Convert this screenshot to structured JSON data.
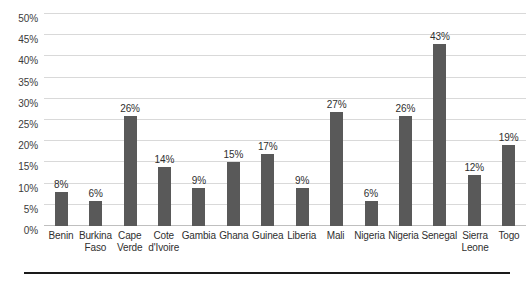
{
  "chart_data": {
    "type": "bar",
    "title": "",
    "subtitle": "",
    "xlabel": "",
    "ylabel": "",
    "ylim": [
      0,
      50
    ],
    "grid": true,
    "legend": false,
    "legend_position": "none",
    "bar_color": "#595959",
    "gridline_color": "#d9d9d9",
    "categories": [
      "Benin",
      "Burkina Faso",
      "Cape Verde",
      "Cote d'Ivoire",
      "Gambia",
      "Ghana",
      "Guinea",
      "Liberia",
      "Mali",
      "Nigeria",
      "Nigeria",
      "Senegal",
      "Sierra Leone",
      "Togo"
    ],
    "category_lines": [
      [
        "Benin"
      ],
      [
        "Burkina",
        "Faso"
      ],
      [
        "Cape",
        "Verde"
      ],
      [
        "Cote",
        "d'Ivoire"
      ],
      [
        "Gambia"
      ],
      [
        "Ghana"
      ],
      [
        "Guinea"
      ],
      [
        "Liberia"
      ],
      [
        "Mali"
      ],
      [
        "Nigeria"
      ],
      [
        "Nigeria"
      ],
      [
        "Senegal"
      ],
      [
        "Sierra",
        "Leone"
      ],
      [
        "Togo"
      ]
    ],
    "values": [
      8,
      6,
      26,
      14,
      9,
      15,
      17,
      9,
      27,
      6,
      26,
      43,
      12,
      19
    ],
    "value_labels": [
      "8%",
      "6%",
      "26%",
      "14%",
      "9%",
      "15%",
      "17%",
      "9%",
      "27%",
      "6%",
      "26%",
      "43%",
      "12%",
      "19%"
    ],
    "yticks": [
      0,
      5,
      10,
      15,
      20,
      25,
      30,
      35,
      40,
      45,
      50
    ],
    "ytick_labels": [
      "0%",
      "5%",
      "10%",
      "15%",
      "20%",
      "25%",
      "30%",
      "35%",
      "40%",
      "45%",
      "50%"
    ]
  }
}
